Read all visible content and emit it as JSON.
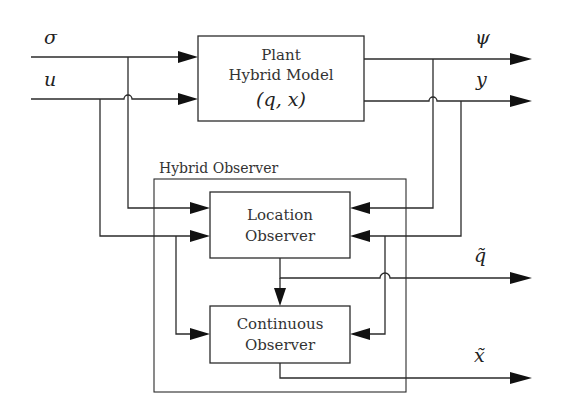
{
  "diagram": {
    "inputs": {
      "sigma": "σ",
      "u": "u"
    },
    "outputs": {
      "psi": "ψ",
      "y": "y",
      "q_tilde": "q̃",
      "x_tilde": "x̃"
    },
    "plant": {
      "line1": "Plant",
      "line2": "Hybrid Model",
      "line3": "(q, x)"
    },
    "hybrid_observer": {
      "title": "Hybrid Observer"
    },
    "location_observer": {
      "line1": "Location",
      "line2": "Observer"
    },
    "continuous_observer": {
      "line1": "Continuous",
      "line2": "Observer"
    },
    "colors": {
      "line": "#2b2b2b",
      "text": "#333333",
      "background": "#ffffff"
    }
  }
}
